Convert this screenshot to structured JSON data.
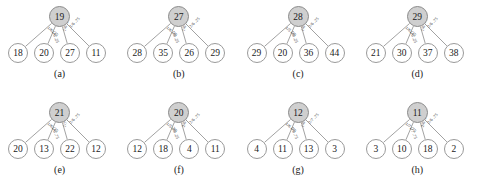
{
  "figure": {
    "rows": [
      {
        "panels": [
          {
            "caption": "(a)",
            "root": "19",
            "leaves": [
              "18",
              "20",
              "27",
              "11"
            ],
            "edge_labels": [
              "1/6 .25",
              "1/6 .25",
              "1/6 .25",
              "1/6 .75"
            ]
          },
          {
            "caption": "(b)",
            "root": "27",
            "leaves": [
              "28",
              "35",
              "26",
              "29"
            ],
            "edge_labels": [
              "1/6 .25",
              "1/6 .25",
              "1/6 .75",
              "2/6 .25"
            ]
          },
          {
            "caption": "(c)",
            "root": "28",
            "leaves": [
              "29",
              "20",
              "36",
              "44"
            ],
            "edge_labels": [
              "1/5 .25",
              "1/6 .25",
              "1/6 .25",
              "2/6 .25"
            ]
          },
          {
            "caption": "(d)",
            "root": "29",
            "leaves": [
              "21",
              "30",
              "37",
              "38"
            ],
            "edge_labels": [
              "1/6 .25",
              "1/6 .25",
              "1/6 .75",
              "2/6 .75"
            ]
          }
        ]
      },
      {
        "panels": [
          {
            "caption": "(e)",
            "root": "21",
            "leaves": [
              "20",
              "13",
              "22",
              "12"
            ],
            "edge_labels": [
              "1/6 .25",
              "1/6 .75",
              "1/7 .75",
              "2/6 .75"
            ]
          },
          {
            "caption": "(f)",
            "root": "20",
            "leaves": [
              "12",
              "18",
              "4",
              "11"
            ],
            "edge_labels": [
              "1/5 .25",
              "2/6 .25",
              "2/6 .75",
              "2/6 .75"
            ]
          },
          {
            "caption": "(g)",
            "root": "12",
            "leaves": [
              "4",
              "11",
              "13",
              "3"
            ],
            "edge_labels": [
              "1/6 .75",
              "1/6 .75",
              "1/6 .75",
              "2/7 .75"
            ]
          },
          {
            "caption": "(h)",
            "root": "11",
            "leaves": [
              "3",
              "10",
              "18",
              "2"
            ],
            "edge_labels": [
              "1/7 .75",
              "1/7 .75",
              "2/6 .25",
              "2/6 .75"
            ]
          }
        ]
      }
    ]
  },
  "style": {
    "root_fill": "#cfcfcf",
    "node_stroke": "#9a9a9a",
    "edge_stroke": "#8a8a8a",
    "text_color": "#1a1a1a",
    "background": "#ffffff"
  }
}
